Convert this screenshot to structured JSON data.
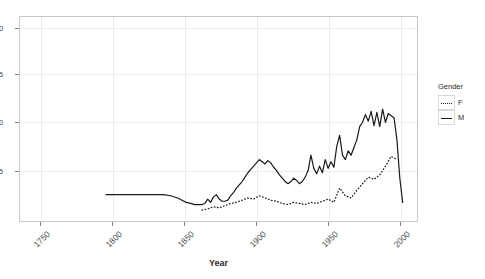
{
  "chart_data": {
    "type": "line",
    "title": "",
    "xlabel": "Year",
    "ylabel": "",
    "xlim": [
      1735,
      2012
    ],
    "ylim": [
      2.6,
      21.2
    ],
    "grid": true,
    "legend": {
      "position": "right",
      "title": "Gender",
      "entries": [
        {
          "label": "F",
          "style": "dotted"
        },
        {
          "label": "M",
          "style": "solid"
        }
      ]
    },
    "xticks": [
      1750,
      1800,
      1850,
      1900,
      1950,
      2000
    ],
    "xtick_labels": [
      "1750",
      "1800",
      "1850",
      "1900",
      "1950",
      "2000"
    ],
    "yticks": [
      5,
      10,
      15,
      20
    ],
    "ytick_labels": [
      "5",
      "10",
      "15",
      "20"
    ],
    "ytick_labels_clipped": [
      "5",
      "0",
      "5",
      "0"
    ],
    "series": [
      {
        "name": "M",
        "style": "solid",
        "color": "#1a1a1a",
        "x": [
          1795,
          1800,
          1805,
          1810,
          1815,
          1820,
          1825,
          1830,
          1835,
          1840,
          1845,
          1848,
          1851,
          1854,
          1857,
          1860,
          1862,
          1864,
          1866,
          1868,
          1870,
          1872,
          1874,
          1876,
          1878,
          1880,
          1882,
          1884,
          1886,
          1888,
          1890,
          1892,
          1894,
          1896,
          1898,
          1900,
          1902,
          1904,
          1906,
          1908,
          1910,
          1912,
          1914,
          1916,
          1918,
          1920,
          1922,
          1924,
          1926,
          1928,
          1930,
          1932,
          1934,
          1936,
          1938,
          1940,
          1942,
          1944,
          1946,
          1948,
          1950,
          1952,
          1954,
          1956,
          1958,
          1960,
          1962,
          1964,
          1966,
          1968,
          1970,
          1972,
          1974,
          1976,
          1978,
          1980,
          1982,
          1984,
          1986,
          1988,
          1990,
          1992,
          1994,
          1996,
          1998,
          2000,
          2002
        ],
        "y": [
          5.0,
          5.0,
          5.0,
          5.0,
          5.0,
          5.0,
          5.0,
          5.0,
          5.0,
          4.9,
          4.7,
          4.5,
          4.3,
          4.2,
          4.1,
          4.1,
          4.1,
          4.2,
          4.6,
          4.3,
          4.8,
          5.0,
          4.6,
          4.4,
          4.4,
          4.5,
          4.9,
          5.2,
          5.6,
          5.9,
          6.2,
          6.6,
          7.0,
          7.3,
          7.6,
          7.9,
          8.2,
          8.0,
          7.8,
          8.1,
          7.9,
          7.5,
          7.2,
          6.8,
          6.5,
          6.2,
          6.0,
          6.2,
          6.5,
          6.3,
          6.0,
          6.2,
          6.6,
          7.2,
          8.6,
          7.4,
          6.9,
          7.6,
          7.0,
          8.2,
          7.4,
          8.0,
          7.5,
          9.4,
          10.4,
          8.6,
          8.2,
          9.0,
          8.6,
          9.3,
          10.0,
          11.2,
          11.6,
          12.3,
          11.7,
          12.6,
          11.3,
          12.5,
          11.2,
          12.8,
          11.6,
          12.4,
          12.2,
          12.0,
          10.0,
          6.5,
          4.3
        ]
      },
      {
        "name": "F",
        "style": "dotted",
        "color": "#1a1a1a",
        "x": [
          1862,
          1866,
          1870,
          1874,
          1878,
          1882,
          1886,
          1890,
          1894,
          1898,
          1902,
          1906,
          1910,
          1914,
          1918,
          1922,
          1926,
          1930,
          1934,
          1938,
          1942,
          1946,
          1950,
          1954,
          1958,
          1962,
          1966,
          1970,
          1974,
          1978,
          1982,
          1986,
          1990,
          1994,
          1998
        ],
        "y": [
          3.6,
          3.7,
          3.9,
          3.8,
          4.0,
          4.2,
          4.3,
          4.5,
          4.7,
          4.6,
          4.9,
          4.7,
          4.5,
          4.4,
          4.2,
          4.1,
          4.3,
          4.2,
          4.1,
          4.3,
          4.2,
          4.4,
          4.6,
          4.3,
          5.6,
          4.9,
          4.7,
          5.4,
          6.0,
          6.6,
          6.4,
          6.8,
          7.6,
          8.5,
          8.2
        ]
      }
    ]
  },
  "legend": {
    "title": "Gender",
    "female_label": "F",
    "male_label": "M"
  },
  "axes": {
    "x_title": "Year",
    "xtick_1": "1750",
    "xtick_2": "1800",
    "xtick_3": "1850",
    "xtick_4": "1900",
    "xtick_5": "1950",
    "xtick_6": "2000",
    "ytick_1": "5",
    "ytick_2": "0",
    "ytick_3": "5",
    "ytick_4": "0"
  }
}
